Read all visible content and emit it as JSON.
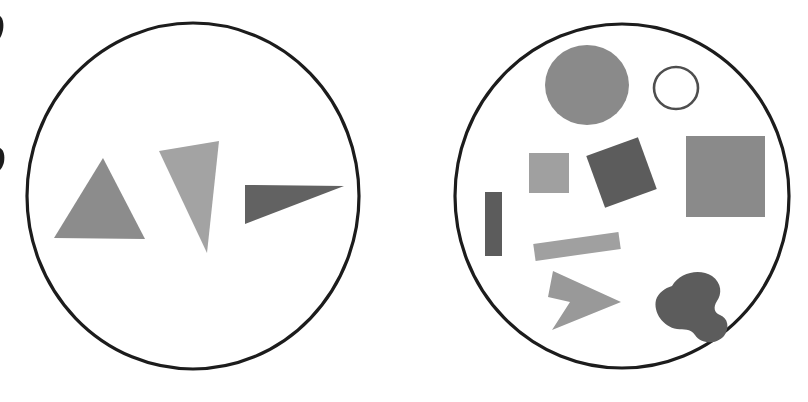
{
  "figure": {
    "width": 808,
    "height": 402,
    "background_color": "#ffffff",
    "title": "",
    "panels": [
      {
        "id": "left-panel",
        "name": "left-circle-panel",
        "outline": {
          "name": "left-circle-outline",
          "shape": "circle",
          "cx": 193,
          "cy": 196,
          "rx": 166,
          "ry": 173,
          "fill": "none",
          "stroke": "#1c1c1c",
          "stroke_width": 3.2
        },
        "shape_count": 3,
        "shapes": [
          {
            "id": "left-shape-1",
            "name": "triangle-up-medium-gray",
            "kind": "triangle",
            "fill": "#8c8c8c",
            "points": "103,158 145,239 54,238",
            "description": "upward pointing triangle, medium gray"
          },
          {
            "id": "left-shape-2",
            "name": "triangle-down-light-gray",
            "kind": "triangle",
            "fill": "#a3a3a3",
            "points": "159,151 219,141 207,253",
            "description": "downward pointing narrow triangle, light gray"
          },
          {
            "id": "left-shape-3",
            "name": "triangle-right-dark-gray",
            "kind": "triangle",
            "fill": "#626262",
            "points": "245,185 344,186 245,224",
            "description": "right pointing wedge triangle, dark gray"
          }
        ]
      },
      {
        "id": "right-panel",
        "name": "right-circle-panel",
        "outline": {
          "name": "right-circle-outline",
          "shape": "circle",
          "cx": 622,
          "cy": 196,
          "rx": 167,
          "ry": 172,
          "fill": "none",
          "stroke": "#1c1c1c",
          "stroke_width": 3.2
        },
        "shape_count": 10,
        "shapes": [
          {
            "id": "right-shape-1",
            "name": "filled-circle-medium-gray",
            "kind": "ellipse",
            "fill": "#8a8a8a",
            "cx": 587,
            "cy": 85,
            "rx": 42,
            "ry": 40,
            "description": "large filled circle, medium gray"
          },
          {
            "id": "right-shape-2",
            "name": "outlined-circle-small",
            "kind": "ellipse-outline",
            "fill": "none",
            "stroke": "#4e4e4e",
            "stroke_width": 2.6,
            "cx": 676,
            "cy": 88,
            "rx": 22,
            "ry": 21,
            "description": "small unfilled circle with dark outline"
          },
          {
            "id": "right-shape-3",
            "name": "square-large-medium-gray",
            "kind": "rect",
            "fill": "#8a8a8a",
            "x": 686,
            "y": 136,
            "width": 79,
            "height": 81,
            "rotation": 0,
            "description": "large square, medium gray"
          },
          {
            "id": "right-shape-4",
            "name": "square-small-light-gray",
            "kind": "rect",
            "fill": "#a0a0a0",
            "x": 529,
            "y": 153,
            "width": 40,
            "height": 40,
            "rotation": 0,
            "description": "small square, light gray"
          },
          {
            "id": "right-shape-5",
            "name": "square-rotated-dark-gray",
            "kind": "rect",
            "fill": "#5c5c5c",
            "x": 594,
            "y": 145,
            "width": 55,
            "height": 55,
            "rotation": -20,
            "description": "rotated square tilted about 20 degrees, dark gray"
          },
          {
            "id": "right-shape-6",
            "name": "rect-vertical-thin-dark-gray",
            "kind": "rect",
            "fill": "#5c5c5c",
            "x": 485,
            "y": 192,
            "width": 17,
            "height": 64,
            "rotation": 0,
            "description": "thin vertical rectangle, dark gray"
          },
          {
            "id": "right-shape-7",
            "name": "bar-slanted-light-gray",
            "kind": "rect",
            "fill": "#a0a0a0",
            "x": 534,
            "y": 238,
            "width": 86,
            "height": 17,
            "rotation": -8,
            "description": "slanted horizontal bar, light gray"
          },
          {
            "id": "right-shape-8",
            "name": "arrow-right-medium-gray",
            "kind": "polygon",
            "fill": "#999999",
            "points": "553,271 621,302 552,330 570,302 548,297",
            "description": "right pointing arrow / chevron, medium gray"
          },
          {
            "id": "right-shape-9",
            "name": "blob-kidney-dark-gray",
            "kind": "path",
            "fill": "#5c5c5c",
            "description": "kidney / bean shaped blob, dark gray"
          },
          {
            "id": "right-shape-10",
            "name": "edge-artifact-mark",
            "kind": "artifact",
            "fill": "#1c1c1c",
            "description": "small dark scanning artifact near left image border"
          }
        ]
      }
    ],
    "colors": {
      "outline_stroke": "#1c1c1c",
      "light_gray": "#a3a3a3",
      "medium_gray": "#8a8a8a",
      "dark_gray": "#5c5c5c",
      "background": "#ffffff"
    }
  }
}
